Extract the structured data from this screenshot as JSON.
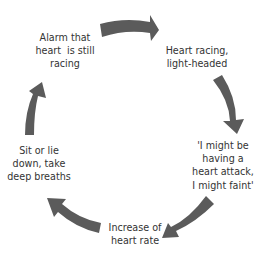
{
  "diagram": {
    "type": "cycle",
    "arrow_color": "#5b5b5b",
    "text_color": "#333333",
    "background": "#ffffff",
    "nodes": [
      {
        "id": "alarm",
        "lines": [
          "Alarm that",
          "heart  is still",
          "racing"
        ]
      },
      {
        "id": "racing",
        "lines": [
          "Heart racing,",
          "light-headed"
        ]
      },
      {
        "id": "thought",
        "lines": [
          "'I might be",
          "having a",
          "heart attack,",
          "I might faint'"
        ]
      },
      {
        "id": "increase",
        "lines": [
          "Increase of",
          "heart rate"
        ]
      },
      {
        "id": "coping",
        "lines": [
          "Sit or lie",
          "down, take",
          "deep breaths"
        ]
      }
    ],
    "edges": [
      {
        "from": "alarm",
        "to": "racing"
      },
      {
        "from": "racing",
        "to": "thought"
      },
      {
        "from": "thought",
        "to": "increase"
      },
      {
        "from": "increase",
        "to": "coping"
      },
      {
        "from": "coping",
        "to": "alarm"
      }
    ]
  }
}
